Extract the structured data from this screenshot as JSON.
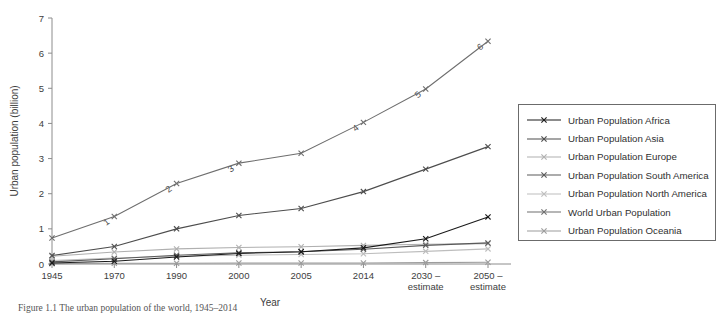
{
  "chart_data": {
    "type": "line",
    "title": "",
    "xlabel": "Year",
    "ylabel": "Urban population (billion)",
    "categories": [
      "1945",
      "1970",
      "1990",
      "2000",
      "2005",
      "2014",
      "2030 –\nestimate",
      "2050 –\nestimate"
    ],
    "category_labels": [
      {
        "line1": "1945",
        "line2": ""
      },
      {
        "line1": "1970",
        "line2": ""
      },
      {
        "line1": "1990",
        "line2": ""
      },
      {
        "line1": "2000",
        "line2": ""
      },
      {
        "line1": "2005",
        "line2": ""
      },
      {
        "line1": "2014",
        "line2": ""
      },
      {
        "line1": "2030 –",
        "line2": "estimate"
      },
      {
        "line1": "2050 –",
        "line2": "estimate"
      }
    ],
    "ylim": [
      0,
      7
    ],
    "yticks": [
      0,
      1,
      2,
      3,
      4,
      5,
      6,
      7
    ],
    "ytick_labels": [
      "0",
      "1",
      "2",
      "3",
      "4",
      "5",
      "6",
      "7"
    ],
    "grid": false,
    "legend_position": "right",
    "series": [
      {
        "name": "Urban Population Africa",
        "color": "#1a1a1a",
        "values": [
          0.03,
          0.08,
          0.2,
          0.3,
          0.35,
          0.46,
          0.72,
          1.34
        ],
        "point_labels": [
          "",
          "",
          "",
          "",
          "",
          "",
          "",
          ""
        ]
      },
      {
        "name": "Urban Population Asia",
        "color": "#4d4d4d",
        "values": [
          0.24,
          0.5,
          1.0,
          1.38,
          1.58,
          2.06,
          2.7,
          3.34
        ],
        "point_labels": [
          "",
          "",
          "",
          "",
          "",
          "",
          "",
          ""
        ]
      },
      {
        "name": "Urban Population Europe",
        "color": "#b0b0b0",
        "values": [
          0.22,
          0.34,
          0.43,
          0.47,
          0.49,
          0.53,
          0.56,
          0.58
        ],
        "point_labels": [
          "",
          "",
          "",
          "",
          "",
          "",
          "",
          ""
        ]
      },
      {
        "name": "Urban Population South America",
        "color": "#5a5a5a",
        "values": [
          0.06,
          0.15,
          0.25,
          0.32,
          0.35,
          0.42,
          0.53,
          0.6
        ],
        "point_labels": [
          "",
          "",
          "",
          "",
          "",
          "",
          "",
          ""
        ]
      },
      {
        "name": "Urban Population North America",
        "color": "#bdbdbd",
        "values": [
          0.1,
          0.17,
          0.22,
          0.25,
          0.27,
          0.29,
          0.36,
          0.43
        ],
        "point_labels": [
          "",
          "",
          "",
          "",
          "",
          "",
          "",
          ""
        ]
      },
      {
        "name": "World Urban Population",
        "color": "#6e6e6e",
        "values": [
          0.74,
          1.35,
          2.29,
          2.87,
          3.15,
          4.03,
          4.98,
          6.34
        ],
        "point_labels": [
          "",
          "1",
          "2",
          "3",
          "",
          "4",
          "5",
          "6"
        ]
      },
      {
        "name": "Urban Population Oceania",
        "color": "#9c9c9c",
        "values": [
          0.01,
          0.02,
          0.02,
          0.03,
          0.03,
          0.03,
          0.04,
          0.05
        ],
        "point_labels": [
          "",
          "",
          "",
          "",
          "",
          "",
          "",
          ""
        ]
      }
    ]
  },
  "caption": {
    "text": "Figure 1.1 The urban population of the world, 1945–2014"
  }
}
